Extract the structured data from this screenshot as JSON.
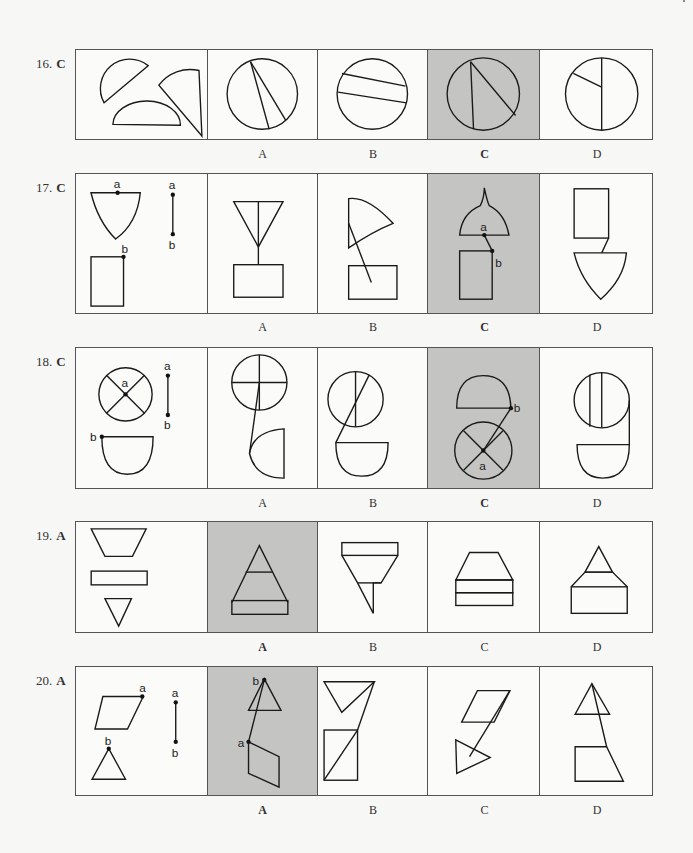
{
  "option_labels": [
    "A",
    "B",
    "C",
    "D"
  ],
  "colors": {
    "selected_background": "#c4c4c2",
    "border": "#555555",
    "stroke": "#1a1a1a"
  },
  "questions": [
    {
      "number": "16.",
      "answer": "C",
      "prompt_pieces": "three circle segments (two circular segments and a semicircle-like segment)",
      "options": [
        {
          "label": "A",
          "figure": "circle with two chords from a common top point",
          "selected": false
        },
        {
          "label": "B",
          "figure": "circle with two parallel slanted chords",
          "selected": false
        },
        {
          "label": "C",
          "figure": "circle with two chords from top-left point (vertical and diagonal)",
          "selected": true
        },
        {
          "label": "D",
          "figure": "circle with vertical diameter and short radius to upper-left",
          "selected": false
        }
      ]
    },
    {
      "number": "17.",
      "answer": "C",
      "prompt_pieces": "curved trapezoid with point a, segment a-b, rectangle with point b",
      "point_labels": [
        "a",
        "a",
        "b",
        "b"
      ],
      "options": [
        {
          "label": "A",
          "figure": "triangle with center line connected to rectangle",
          "selected": false
        },
        {
          "label": "B",
          "figure": "curved sail shape with line into rectangle",
          "selected": false
        },
        {
          "label": "C",
          "figure": "onion dome joined to rectangle via a-b segment",
          "selected": true,
          "point_labels": [
            "a",
            "b"
          ]
        },
        {
          "label": "D",
          "figure": "rectangle joined to inverted curved shape",
          "selected": false
        }
      ]
    },
    {
      "number": "18.",
      "answer": "C",
      "prompt_pieces": "circle with X cross and center a, segment a-b, half-oval with point b",
      "point_labels": [
        "a",
        "a",
        "b",
        "b"
      ],
      "options": [
        {
          "label": "A",
          "figure": "circle with plus cross, line to quarter shape",
          "selected": false
        },
        {
          "label": "B",
          "figure": "circle with lines, line to half-oval",
          "selected": false
        },
        {
          "label": "C",
          "figure": "half-dome above circle with X, connected a-b",
          "selected": true,
          "point_labels": [
            "b",
            "a"
          ]
        },
        {
          "label": "D",
          "figure": "circle with two vertical lines joined to half-oval",
          "selected": false
        }
      ]
    },
    {
      "number": "19.",
      "answer": "A",
      "prompt_pieces": "inverted trapezoid, rectangle, inverted triangle",
      "options": [
        {
          "label": "A",
          "figure": "triangle with horizontal line atop rectangle",
          "selected": true
        },
        {
          "label": "B",
          "figure": "rectangle over inverted trapezoid with triangle",
          "selected": false
        },
        {
          "label": "C",
          "figure": "trapezoid on two stacked rectangles",
          "selected": false
        },
        {
          "label": "D",
          "figure": "triangle on trapezoid on rectangle",
          "selected": false
        }
      ]
    },
    {
      "number": "20.",
      "answer": "A",
      "prompt_pieces": "parallelogram with point a, segment a-b, triangle with point b",
      "point_labels": [
        "a",
        "a",
        "b",
        "b"
      ],
      "options": [
        {
          "label": "A",
          "figure": "triangle apex b joined to parallelogram corner a",
          "selected": true,
          "point_labels": [
            "b",
            "a"
          ]
        },
        {
          "label": "B",
          "figure": "inverted triangle and rectangle with diagonal",
          "selected": false
        },
        {
          "label": "C",
          "figure": "parallelogram with line to triangle",
          "selected": false
        },
        {
          "label": "D",
          "figure": "triangle with line to trapezoid",
          "selected": false
        }
      ]
    }
  ]
}
